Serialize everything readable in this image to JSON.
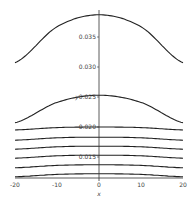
{
  "chart_data": {
    "type": "line",
    "title": "",
    "xlabel": "x",
    "ylabel": "y",
    "xlim": [
      -20,
      20
    ],
    "ylim": [
      0.0115,
      0.0392
    ],
    "grid": false,
    "legend": null,
    "x_ticks": [
      "-20",
      "-10",
      "0",
      "10",
      "20"
    ],
    "y_ticks": [
      "0.015",
      "0.020",
      "0.025",
      "0.030",
      "0.035"
    ],
    "x": [
      -20,
      -10,
      0,
      10,
      20
    ],
    "series": [
      {
        "name": "curve-1",
        "values": [
          0.0307,
          0.0367,
          0.0387,
          0.0367,
          0.0307
        ]
      },
      {
        "name": "curve-2",
        "values": [
          0.0207,
          0.0241,
          0.0253,
          0.0241,
          0.0207
        ]
      },
      {
        "name": "curve-3",
        "values": [
          0.0195,
          0.0199,
          0.02,
          0.0199,
          0.0195
        ]
      },
      {
        "name": "curve-4",
        "values": [
          0.0178,
          0.0182,
          0.0183,
          0.0182,
          0.0178
        ]
      },
      {
        "name": "curve-5",
        "values": [
          0.0163,
          0.0167,
          0.0168,
          0.0167,
          0.0163
        ]
      },
      {
        "name": "curve-6",
        "values": [
          0.0148,
          0.0152,
          0.0153,
          0.0152,
          0.0148
        ]
      },
      {
        "name": "curve-7",
        "values": [
          0.0132,
          0.0136,
          0.0137,
          0.0136,
          0.0132
        ]
      },
      {
        "name": "curve-8",
        "values": [
          0.0117,
          0.0121,
          0.0122,
          0.0121,
          0.0117
        ]
      }
    ]
  }
}
